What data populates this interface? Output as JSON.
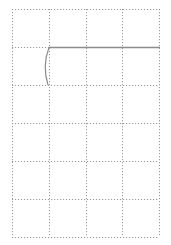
{
  "grid": {
    "origin": [
      12,
      9
    ],
    "columns": 4,
    "rows": 6,
    "cell_width": 36.75,
    "cell_height": 38,
    "line_color": "#9a9a9a",
    "dash": "1.2 1.8"
  },
  "strokes": {
    "color": "#8c8c8c",
    "horizontal_line": {
      "x1": 49,
      "y1": 47.5,
      "x2": 160,
      "y2": 47.5
    },
    "arc": {
      "start": [
        49,
        47.5
      ],
      "control": [
        42,
        66
      ],
      "end": [
        48,
        85
      ]
    }
  }
}
